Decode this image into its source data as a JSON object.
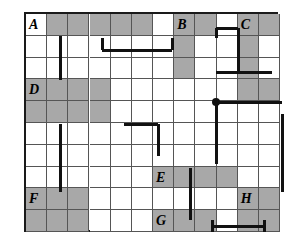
{
  "figure": {
    "kind": "grid-routing-diagram",
    "title": "",
    "grid": {
      "columns": 12,
      "rows": 10,
      "cell_width": 21.17,
      "cell_height": 21.8
    },
    "colors": {
      "background": "#ffffff",
      "shaded_cell": "#a8a8a8",
      "plain_cell": "#ffffff",
      "grid_line": "#555555",
      "border": "#1a1a1a",
      "route_line": "#111111",
      "node": "#111111"
    },
    "shaded_cells": [
      [
        0,
        1
      ],
      [
        0,
        2
      ],
      [
        0,
        3
      ],
      [
        0,
        4
      ],
      [
        0,
        5
      ],
      [
        0,
        7
      ],
      [
        0,
        8
      ],
      [
        0,
        10
      ],
      [
        0,
        11
      ],
      [
        1,
        7
      ],
      [
        1,
        10
      ],
      [
        2,
        7
      ],
      [
        2,
        10
      ],
      [
        3,
        0
      ],
      [
        3,
        1
      ],
      [
        3,
        2
      ],
      [
        3,
        3
      ],
      [
        3,
        10
      ],
      [
        3,
        11
      ],
      [
        4,
        0
      ],
      [
        4,
        1
      ],
      [
        4,
        2
      ],
      [
        4,
        3
      ],
      [
        7,
        6
      ],
      [
        7,
        7
      ],
      [
        7,
        8
      ],
      [
        7,
        9
      ],
      [
        8,
        0
      ],
      [
        8,
        1
      ],
      [
        8,
        2
      ],
      [
        8,
        10
      ],
      [
        8,
        11
      ],
      [
        9,
        0
      ],
      [
        9,
        1
      ],
      [
        9,
        2
      ],
      [
        9,
        6
      ],
      [
        9,
        7
      ],
      [
        9,
        8
      ],
      [
        9,
        10
      ],
      [
        9,
        11
      ]
    ],
    "labels": [
      {
        "text": "A",
        "row": 0,
        "col": 0
      },
      {
        "text": "B",
        "row": 0,
        "col": 7
      },
      {
        "text": "C",
        "row": 0,
        "col": 10
      },
      {
        "text": "D",
        "row": 3,
        "col": 0
      },
      {
        "text": "E",
        "row": 7,
        "col": 6
      },
      {
        "text": "F",
        "row": 8,
        "col": 0
      },
      {
        "text": "G",
        "row": 9,
        "col": 6
      },
      {
        "text": "H",
        "row": 8,
        "col": 10
      }
    ],
    "routes": [
      {
        "name": "route-top-left-hook",
        "segments": [
          {
            "orient": "v",
            "x": 76,
            "y": 24,
            "length": 12
          },
          {
            "orient": "h",
            "x": 76,
            "y": 36,
            "length": 70
          },
          {
            "orient": "v",
            "x": 146,
            "y": 24,
            "length": 12
          }
        ]
      },
      {
        "name": "route-left-vertical-upper",
        "segments": [
          {
            "orient": "v",
            "x": 34,
            "y": 22,
            "length": 44
          }
        ]
      },
      {
        "name": "route-b-zigzag",
        "segments": [
          {
            "orient": "v",
            "x": 190,
            "y": 14,
            "length": 10
          },
          {
            "orient": "h",
            "x": 190,
            "y": 14,
            "length": 22
          },
          {
            "orient": "v",
            "x": 212,
            "y": 14,
            "length": 44
          },
          {
            "orient": "h",
            "x": 190,
            "y": 58,
            "length": 22
          },
          {
            "orient": "v",
            "x": 190,
            "y": 58,
            "length": 0
          },
          {
            "orient": "h",
            "x": 190,
            "y": 58,
            "length": 56
          }
        ]
      },
      {
        "name": "route-node-branch",
        "segments": [
          {
            "orient": "h",
            "x": 190,
            "y": 88,
            "length": 66
          },
          {
            "orient": "v",
            "x": 190,
            "y": 88,
            "length": 62
          }
        ]
      },
      {
        "name": "route-d-hook",
        "segments": [
          {
            "orient": "h",
            "x": 98,
            "y": 110,
            "length": 34
          },
          {
            "orient": "v",
            "x": 132,
            "y": 110,
            "length": 32
          }
        ]
      },
      {
        "name": "route-left-vertical-lower",
        "segments": [
          {
            "orient": "v",
            "x": 34,
            "y": 110,
            "length": 68
          }
        ]
      },
      {
        "name": "route-right-vertical",
        "segments": [
          {
            "orient": "v",
            "x": 256,
            "y": 100,
            "length": 78
          }
        ]
      },
      {
        "name": "route-e-vertical",
        "segments": [
          {
            "orient": "v",
            "x": 164,
            "y": 154,
            "length": 52
          }
        ]
      },
      {
        "name": "route-g-horizontal",
        "segments": [
          {
            "orient": "h",
            "x": 186,
            "y": 212,
            "length": 52
          },
          {
            "orient": "v",
            "x": 186,
            "y": 206,
            "length": 12
          },
          {
            "orient": "v",
            "x": 238,
            "y": 206,
            "length": 12
          }
        ]
      }
    ],
    "nodes": [
      {
        "name": "junction-dot",
        "x": 190,
        "y": 88,
        "radius": 4
      }
    ]
  }
}
